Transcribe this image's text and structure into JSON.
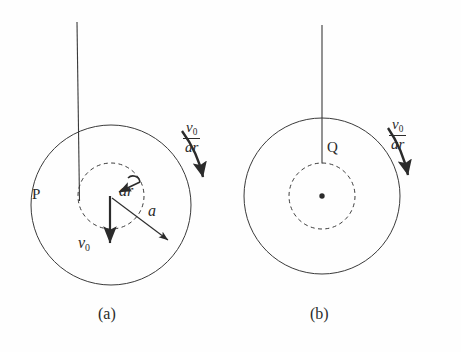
{
  "figure": {
    "background_color": "#fefefe",
    "stroke_color": "#2b2b2b",
    "panels": [
      {
        "id": "panel-a",
        "caption": "(a)",
        "outer_circle": {
          "cx": 111,
          "cy": 205,
          "r": 80,
          "style": "solid"
        },
        "inner_circle": {
          "cx": 111,
          "cy": 196,
          "r": 33,
          "style": "dashed"
        },
        "string": {
          "x1": 77,
          "y1": 22,
          "x2": 79,
          "y2": 201
        },
        "point_label": "P",
        "vectors": [
          {
            "name": "ar",
            "label": "ar",
            "kind": "curved-arrow"
          },
          {
            "name": "a",
            "label": "a",
            "kind": "straight-arrow"
          },
          {
            "name": "v0",
            "label": "v",
            "sub": "0",
            "kind": "straight-arrow"
          }
        ],
        "rotation_label": {
          "numerator": "v",
          "numerator_sub": "0",
          "denominator": "ar"
        }
      },
      {
        "id": "panel-b",
        "caption": "(b)",
        "outer_circle": {
          "cx": 322,
          "cy": 196,
          "r": 78,
          "style": "solid"
        },
        "inner_circle": {
          "cx": 322,
          "cy": 196,
          "r": 33,
          "style": "dashed"
        },
        "string": {
          "x1": 322,
          "y1": 25,
          "x2": 322,
          "y2": 163
        },
        "point_label": "Q",
        "center_dot": {
          "cx": 322,
          "cy": 196,
          "r": 2.6
        },
        "rotation_label": {
          "numerator": "v",
          "numerator_sub": "0",
          "denominator": "ar"
        }
      }
    ]
  }
}
